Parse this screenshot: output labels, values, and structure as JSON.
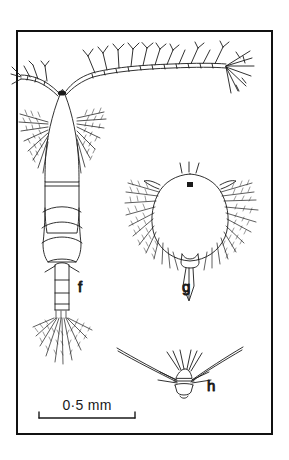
{
  "figure": {
    "kind": "scientific-illustration-plate",
    "background_color": "#ffffff",
    "ink_color": "#1a1a1a",
    "frame": {
      "x": 17,
      "y": 31,
      "width": 255,
      "height": 403,
      "stroke_width": 2,
      "color": "#111111"
    },
    "panels": [
      {
        "id": "f",
        "label": "f",
        "label_x": 78,
        "label_y": 292,
        "description": "adult copepod, dorsal view, with long first antennae, segmented prosome and urosome, and plumose caudal setae"
      },
      {
        "id": "g",
        "label": "g",
        "label_x": 182,
        "label_y": 292,
        "description": "nauplius larva with rounded body, eye spot, and paired plumose swimming appendages"
      },
      {
        "id": "h",
        "label": "h",
        "label_x": 207,
        "label_y": 391,
        "description": "detail of V-shaped appendage with central body and radiating spines"
      }
    ],
    "scale_bar": {
      "text": "0·5 mm",
      "x_start": 39,
      "x_end": 135,
      "y": 418,
      "tick_height": 6,
      "label_x": 87,
      "label_y": 410
    }
  }
}
